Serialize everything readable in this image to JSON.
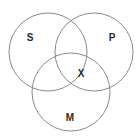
{
  "diagram": {
    "type": "venn",
    "stroke_color": "#8a8a8a",
    "label_color": "#2a2a2a",
    "sets": [
      {
        "label": "S",
        "cx": 48,
        "cy": 52,
        "r": 39,
        "label_x": 30,
        "label_y": 37
      },
      {
        "label": "P",
        "cx": 94,
        "cy": 52,
        "r": 39,
        "label_x": 112,
        "label_y": 37
      },
      {
        "label": "M",
        "cx": 71,
        "cy": 92,
        "r": 39,
        "label_x": 70,
        "label_y": 117
      }
    ],
    "marker": {
      "label": "X",
      "x": 81,
      "y": 73
    }
  }
}
